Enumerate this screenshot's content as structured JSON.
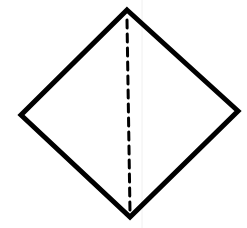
{
  "diagram": {
    "type": "geometric-figure",
    "shape": "rhombus",
    "background_color": "#ffffff",
    "stroke_color": "#000000",
    "outline": {
      "vertices": {
        "top": [
          127,
          10
        ],
        "right": [
          238,
          111
        ],
        "bottom": [
          130,
          217
        ],
        "left": [
          21,
          115
        ]
      },
      "stroke_width": 5
    },
    "diagonal": {
      "style": "dashed",
      "from": [
        127,
        20
      ],
      "to": [
        130,
        212
      ],
      "stroke_width": 3,
      "dash": "8 6"
    },
    "guide_line": {
      "x": 142,
      "color": "#f0f0f0",
      "stroke_width": 1
    }
  }
}
